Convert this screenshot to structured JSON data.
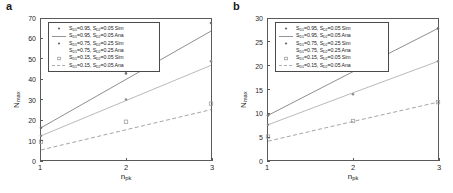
{
  "figure": {
    "panels": [
      {
        "label": "a",
        "axis": {
          "xlabel_main": "n",
          "xlabel_sub": "pk",
          "ylabel_main": "N",
          "ylabel_sub": "max",
          "xticks": [
            "1",
            "2",
            "3"
          ],
          "yticks": [
            "0",
            "10",
            "20",
            "30",
            "40",
            "50",
            "60",
            "70"
          ]
        },
        "legend": [
          {
            "marker": "dot",
            "line": "none",
            "text_parts": [
              "S",
              "D1",
              "=0.95, S",
              "D2",
              "=0.05 Sim"
            ]
          },
          {
            "marker": "none",
            "line": "solid",
            "text_parts": [
              "S",
              "D1",
              "=0.95, S",
              "D2",
              "=0.05 Ana"
            ]
          },
          {
            "marker": "dot",
            "line": "none",
            "text_parts": [
              "S",
              "D1",
              "=0.75, S",
              "D2",
              "=0.25 Sim"
            ]
          },
          {
            "marker": "none",
            "line": "solid2",
            "text_parts": [
              "S",
              "D1",
              "=0.75, S",
              "D2",
              "=0.25 Ana"
            ]
          },
          {
            "marker": "square",
            "line": "none",
            "text_parts": [
              "S",
              "D1",
              "=0.15, S",
              "D2",
              "=0.05 Sim"
            ]
          },
          {
            "marker": "none",
            "line": "dashed",
            "text_parts": [
              "S",
              "D1",
              "=0.15, S",
              "D2",
              "=0.05 Ana"
            ]
          }
        ]
      },
      {
        "label": "b",
        "axis": {
          "xlabel_main": "n",
          "xlabel_sub": "pk",
          "ylabel_main": "N",
          "ylabel_sub": "max",
          "xticks": [
            "1",
            "2",
            "3"
          ],
          "yticks": [
            "0",
            "5",
            "10",
            "15",
            "20",
            "25",
            "30"
          ]
        },
        "legend": [
          {
            "marker": "dot",
            "line": "none",
            "text_parts": [
              "S",
              "D1",
              "=0.95, S",
              "D2",
              "=0.05 Sim"
            ]
          },
          {
            "marker": "none",
            "line": "solid",
            "text_parts": [
              "S",
              "D1",
              "=0.95, S",
              "D2",
              "=0.05 Ana"
            ]
          },
          {
            "marker": "dot",
            "line": "none",
            "text_parts": [
              "S",
              "D1",
              "=0.75, S",
              "D2",
              "=0.25 Sim"
            ]
          },
          {
            "marker": "none",
            "line": "solid2",
            "text_parts": [
              "S",
              "D1",
              "=0.75, S",
              "D2",
              "=0.25 Ana"
            ]
          },
          {
            "marker": "square",
            "line": "none",
            "text_parts": [
              "S",
              "D1",
              "=0.15, S",
              "D2",
              "=0.05 Sim"
            ]
          },
          {
            "marker": "none",
            "line": "dashed",
            "text_parts": [
              "S",
              "D1",
              "=0.15, S",
              "D2",
              "=0.05 Ana"
            ]
          }
        ]
      }
    ]
  },
  "chart_data": [
    {
      "type": "line",
      "panel": "a",
      "title": "",
      "xlabel": "n_pk",
      "ylabel": "N_max",
      "xlim": [
        1,
        3
      ],
      "ylim": [
        0,
        70
      ],
      "xticks": [
        1,
        2,
        3
      ],
      "yticks": [
        0,
        10,
        20,
        30,
        40,
        50,
        60,
        70
      ],
      "grid": false,
      "legend_position": "upper-left-inside",
      "x": [
        1,
        2,
        3
      ],
      "series": [
        {
          "name": "S_D1=0.95, S_D2=0.05 Ana",
          "style": "solid",
          "color": "#808080",
          "values": [
            16.0,
            40.0,
            64.0
          ]
        },
        {
          "name": "S_D1=0.75, S_D2=0.25 Ana",
          "style": "solid",
          "color": "#b0b0b0",
          "values": [
            12.0,
            29.5,
            47.0
          ]
        },
        {
          "name": "S_D1=0.15, S_D2=0.05 Ana",
          "style": "dashed",
          "color": "#9a9a9a",
          "values": [
            5.0,
            15.0,
            25.0
          ]
        },
        {
          "name": "S_D1=0.95, S_D2=0.05 Sim",
          "style": "marker",
          "marker": "dot",
          "color": "#707070",
          "values": [
            16.0,
            43.0,
            68.0
          ]
        },
        {
          "name": "S_D1=0.75, S_D2=0.25 Sim",
          "style": "marker",
          "marker": "dot",
          "color": "#8c8c8c",
          "values": [
            12.0,
            30.0,
            49.0
          ]
        },
        {
          "name": "S_D1=0.15, S_D2=0.05 Sim",
          "style": "marker",
          "marker": "square",
          "color": "#a0a0a0",
          "values": [
            9.0,
            19.0,
            28.0
          ]
        }
      ]
    },
    {
      "type": "line",
      "panel": "b",
      "title": "",
      "xlabel": "n_pk",
      "ylabel": "N_max",
      "xlim": [
        1,
        3
      ],
      "ylim": [
        0,
        30
      ],
      "xticks": [
        1,
        2,
        3
      ],
      "yticks": [
        0,
        5,
        10,
        15,
        20,
        25,
        30
      ],
      "grid": false,
      "legend_position": "upper-left-inside",
      "x": [
        1,
        2,
        3
      ],
      "series": [
        {
          "name": "S_D1=0.95, S_D2=0.05 Ana",
          "style": "solid",
          "color": "#808080",
          "values": [
            9.5,
            18.8,
            28.0
          ]
        },
        {
          "name": "S_D1=0.75, S_D2=0.25 Ana",
          "style": "solid",
          "color": "#b0b0b0",
          "values": [
            7.5,
            14.3,
            21.0
          ]
        },
        {
          "name": "S_D1=0.15, S_D2=0.05 Ana",
          "style": "dashed",
          "color": "#9a9a9a",
          "values": [
            4.0,
            8.2,
            12.3
          ]
        },
        {
          "name": "S_D1=0.95, S_D2=0.05 Sim",
          "style": "marker",
          "marker": "dot",
          "color": "#707070",
          "values": [
            9.5,
            19.0,
            28.0
          ]
        },
        {
          "name": "S_D1=0.75, S_D2=0.25 Sim",
          "style": "marker",
          "marker": "dot",
          "color": "#8c8c8c",
          "values": [
            7.5,
            14.0,
            21.0
          ]
        },
        {
          "name": "S_D1=0.15, S_D2=0.05 Sim",
          "style": "marker",
          "marker": "square",
          "color": "#a0a0a0",
          "values": [
            5.0,
            8.3,
            12.3
          ]
        }
      ]
    }
  ]
}
